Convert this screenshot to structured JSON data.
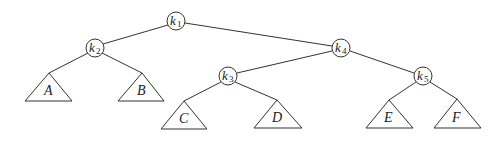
{
  "diagram": {
    "type": "binary-search-tree",
    "nodes": [
      {
        "id": "k1",
        "base": "k",
        "sub": "1",
        "x": 176,
        "y": 21
      },
      {
        "id": "k2",
        "base": "k",
        "sub": "2",
        "x": 95,
        "y": 48
      },
      {
        "id": "k4",
        "base": "k",
        "sub": "4",
        "x": 341,
        "y": 48
      },
      {
        "id": "k3",
        "base": "k",
        "sub": "3",
        "x": 228,
        "y": 76
      },
      {
        "id": "k5",
        "base": "k",
        "sub": "5",
        "x": 423,
        "y": 76
      }
    ],
    "subtrees": [
      {
        "id": "A",
        "label": "A",
        "parent": "k2"
      },
      {
        "id": "B",
        "label": "B",
        "parent": "k2"
      },
      {
        "id": "C",
        "label": "C",
        "parent": "k3"
      },
      {
        "id": "D",
        "label": "D",
        "parent": "k3"
      },
      {
        "id": "E",
        "label": "E",
        "parent": "k5"
      },
      {
        "id": "F",
        "label": "F",
        "parent": "k5"
      }
    ],
    "edges": [
      [
        "k1",
        "k2"
      ],
      [
        "k1",
        "k4"
      ],
      [
        "k2",
        "A"
      ],
      [
        "k2",
        "B"
      ],
      [
        "k4",
        "k3"
      ],
      [
        "k4",
        "k5"
      ],
      [
        "k3",
        "C"
      ],
      [
        "k3",
        "D"
      ],
      [
        "k5",
        "E"
      ],
      [
        "k5",
        "F"
      ]
    ]
  }
}
